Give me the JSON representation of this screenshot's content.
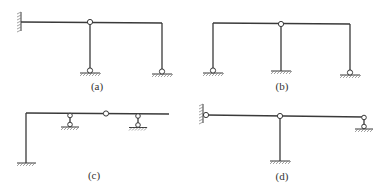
{
  "figure": {
    "panels": [
      {
        "id": "a",
        "label": "(a)",
        "description": "Frame with left fixed wall, intermediate hinge on beam over pinned column, right pinned column"
      },
      {
        "id": "b",
        "label": "(b)",
        "description": "Portal frame with pinned left column, middle fixed column with hinge at top, pinned right column"
      },
      {
        "id": "c",
        "label": "(c)",
        "description": "L-frame fixed at base with two link supports on beam and an intermediate hinge, overhang to right"
      },
      {
        "id": "d",
        "label": "(d)",
        "description": "Beam pinned to left wall, hinge over fixed central column, link support at right end"
      }
    ]
  },
  "colors": {
    "line": "#3a3a3a",
    "hatch": "#7a7a7a",
    "background": "#ffffff"
  }
}
